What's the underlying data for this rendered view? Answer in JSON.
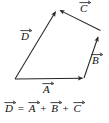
{
  "figure": {
    "type": "vector-addition-diagram",
    "background_color": "#ffffff",
    "stroke_color": "#262626",
    "text_color": "#111111",
    "labels": {
      "a": "A",
      "b": "B",
      "c": "C",
      "d": "D"
    },
    "equation": {
      "lhs": "D",
      "equals": "=",
      "term1": "A",
      "plus1": "+",
      "term2": "B",
      "plus2": "+",
      "term3": "C"
    },
    "vectors": [
      {
        "name": "A",
        "label": "A",
        "tail": [
          15,
          79
        ],
        "head": [
          84,
          78
        ],
        "direction": "right",
        "label_position": "below"
      },
      {
        "name": "B",
        "label": "B",
        "tail": [
          84,
          78
        ],
        "head": [
          99,
          34
        ],
        "direction": "up-right",
        "label_position": "right"
      },
      {
        "name": "C",
        "label": "C",
        "tail": [
          100,
          30
        ],
        "head": [
          58,
          9
        ],
        "direction": "up-left",
        "label_position": "above"
      },
      {
        "name": "D",
        "label": "D",
        "tail": [
          15,
          79
        ],
        "head": [
          57,
          9
        ],
        "direction": "up-right",
        "label_position": "left",
        "is_resultant": true
      }
    ]
  }
}
